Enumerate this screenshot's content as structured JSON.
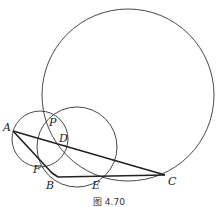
{
  "figure": {
    "caption": "图 4.70",
    "points": {
      "A": {
        "label": "A",
        "x": 13,
        "y": 131
      },
      "B": {
        "label": "B",
        "x": 56,
        "y": 177
      },
      "C": {
        "label": "C",
        "x": 165,
        "y": 175
      },
      "D": {
        "label": "D",
        "x": 57,
        "y": 142
      },
      "E": {
        "label": "E",
        "x": 96,
        "y": 176
      },
      "F": {
        "label": "F",
        "x": 40,
        "y": 160
      },
      "P": {
        "label": "P",
        "x": 46,
        "y": 118
      }
    },
    "circles": [
      {
        "name": "large-circle",
        "cx": 128,
        "cy": 95,
        "r": 86
      },
      {
        "name": "small-circle-APF",
        "cx": 40,
        "cy": 139,
        "r": 28
      },
      {
        "name": "medium-circle-PDE",
        "cx": 77,
        "cy": 147,
        "r": 40
      }
    ],
    "stroke_color": "#333333"
  }
}
